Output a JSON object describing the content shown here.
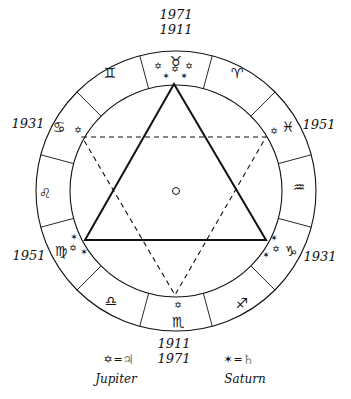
{
  "diagram": {
    "center_marker": "sun-circle",
    "colors": {
      "ink": "#111111",
      "background": "#ffffff"
    },
    "geometry": {
      "center": [
        176,
        191
      ],
      "outer_radius": 140,
      "inner_radius": 106
    },
    "zodiac_ring": [
      {
        "name": "taurus",
        "glyph": "♉",
        "position": "top"
      },
      {
        "name": "aries",
        "glyph": "♈",
        "position": "top-right"
      },
      {
        "name": "pisces",
        "glyph": "♓",
        "position": "right-upper"
      },
      {
        "name": "aquarius",
        "glyph": "♒",
        "position": "right"
      },
      {
        "name": "capricorn",
        "glyph": "♑",
        "position": "right-lower"
      },
      {
        "name": "sagittarius",
        "glyph": "♐",
        "position": "bottom-right"
      },
      {
        "name": "scorpio",
        "glyph": "♏",
        "position": "bottom"
      },
      {
        "name": "libra",
        "glyph": "♎",
        "position": "bottom-left"
      },
      {
        "name": "virgo",
        "glyph": "♍",
        "position": "left-lower"
      },
      {
        "name": "leo",
        "glyph": "♌",
        "position": "left"
      },
      {
        "name": "cancer",
        "glyph": "♋",
        "position": "left-upper"
      },
      {
        "name": "gemini",
        "glyph": "♊",
        "position": "top-left"
      }
    ],
    "year_labels": {
      "top": [
        "1971",
        "1911"
      ],
      "bottom": [
        "1911",
        "1971"
      ],
      "left_upper": "1931",
      "left_lower": "1951",
      "right_upper": "1951",
      "right_lower": "1931"
    },
    "triangles": {
      "solid": {
        "style": "solid",
        "points": [
          [
            174,
            84
          ],
          [
            85,
            240
          ],
          [
            266,
            240
          ]
        ]
      },
      "dashed": {
        "style": "dashed",
        "points": [
          [
            82,
            137
          ],
          [
            266,
            137
          ],
          [
            175,
            295
          ]
        ]
      }
    },
    "planet_marks": {
      "jupiter_symbol": "✡",
      "saturn_symbol": "✶"
    }
  },
  "legend": {
    "jupiter": {
      "symbol": "✡",
      "equals": "=",
      "planet_glyph": "♃",
      "label": "Jupiter"
    },
    "saturn": {
      "symbol": "✶",
      "equals": "=",
      "planet_glyph": "♄",
      "label": "Saturn"
    }
  }
}
